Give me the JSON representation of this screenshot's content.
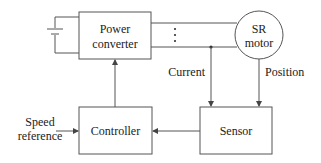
{
  "diagram": {
    "blocks": {
      "power_converter": {
        "line1": "Power",
        "line2": "converter"
      },
      "motor": {
        "line1": "SR",
        "line2": "motor"
      },
      "controller": {
        "label": "Controller"
      },
      "sensor": {
        "label": "Sensor"
      }
    },
    "signals": {
      "current": "Current",
      "position": "Position",
      "speed_reference_line1": "Speed",
      "speed_reference_line2": "reference"
    },
    "colors": {
      "stroke": "#555555",
      "text": "#222222",
      "background": "#ffffff"
    }
  }
}
